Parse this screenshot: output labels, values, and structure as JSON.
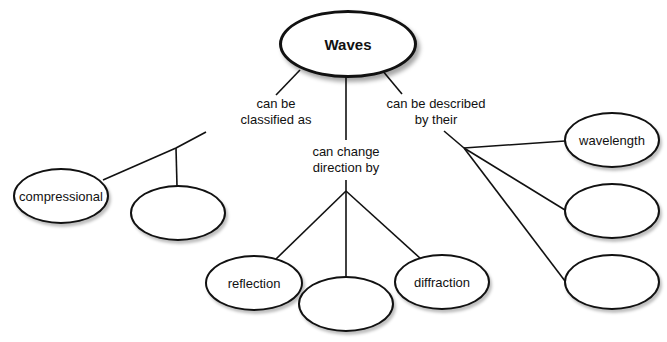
{
  "diagram": {
    "root": {
      "label": "Waves"
    },
    "links": {
      "classified": {
        "line1": "can be",
        "line2": "classified as"
      },
      "direction": {
        "line1": "can change",
        "line2": "direction by"
      },
      "described": {
        "line1": "can be described",
        "line2": "by their"
      }
    },
    "nodes": {
      "compressional": "compressional",
      "classified_blank": "",
      "reflection": "reflection",
      "direction_blank": "",
      "diffraction": "diffraction",
      "wavelength": "wavelength",
      "described_blank_1": "",
      "described_blank_2": ""
    }
  }
}
